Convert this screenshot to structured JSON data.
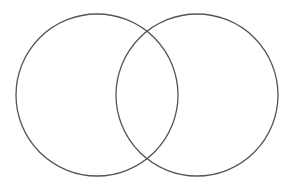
{
  "diagram": {
    "type": "venn",
    "background": "#ffffff",
    "stroke_color": "#555555",
    "stroke_width": 1.3,
    "sets": [
      {
        "id": "left",
        "label": "",
        "cx": 97,
        "cy": 95,
        "r": 81
      },
      {
        "id": "right",
        "label": "",
        "cx": 197,
        "cy": 95,
        "r": 81
      }
    ]
  }
}
